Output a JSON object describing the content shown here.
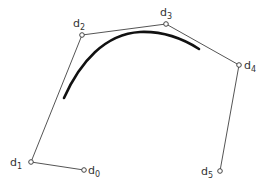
{
  "diagram": {
    "type": "control-polygon-with-spline-curve",
    "control_points": [
      {
        "id": "d0",
        "label": "d",
        "sub": "0",
        "x": 84,
        "y": 170,
        "lx": 88,
        "ly": 174
      },
      {
        "id": "d1",
        "label": "d",
        "sub": "1",
        "x": 31,
        "y": 162,
        "lx": 10,
        "ly": 166
      },
      {
        "id": "d2",
        "label": "d",
        "sub": "2",
        "x": 82,
        "y": 35,
        "lx": 73,
        "ly": 27
      },
      {
        "id": "d3",
        "label": "d",
        "sub": "3",
        "x": 166,
        "y": 24,
        "lx": 160,
        "ly": 16
      },
      {
        "id": "d4",
        "label": "d",
        "sub": "4",
        "x": 239,
        "y": 65,
        "lx": 244,
        "ly": 69
      },
      {
        "id": "d5",
        "label": "d",
        "sub": "5",
        "x": 220,
        "y": 171,
        "lx": 201,
        "ly": 175
      }
    ],
    "polygon_order": [
      "d0",
      "d1",
      "d2",
      "d3",
      "d4",
      "d5"
    ],
    "curve_path": "M 64 98 C 80 62, 105 34, 140 32 C 165 31, 185 40, 199 49",
    "colors": {
      "polygon": "#555555",
      "curve": "#111111",
      "point_fill": "#ffffff"
    }
  }
}
